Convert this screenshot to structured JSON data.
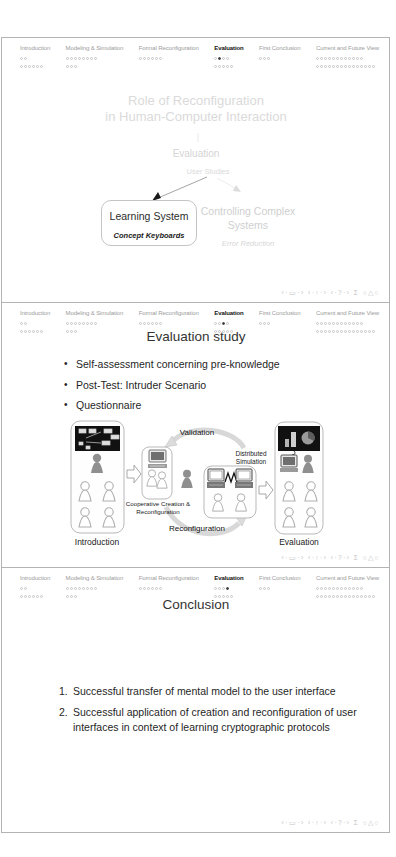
{
  "header": {
    "active_section_index": 3,
    "sections": [
      {
        "label": "Introduction",
        "rows": [
          2,
          6
        ]
      },
      {
        "label": "Modeling & Simulation",
        "rows": [
          8,
          3
        ]
      },
      {
        "label": "Formal Reconfiguration",
        "rows": [
          6
        ]
      },
      {
        "label": "Evaluation",
        "rows": [
          4,
          5
        ]
      },
      {
        "label": "First Conclusion",
        "rows": [
          3
        ]
      },
      {
        "label": "Current and Future View",
        "rows": [
          12,
          15
        ]
      }
    ]
  },
  "footer": {
    "nav_symbols": "‹·▭·›  ‹·↑·›  ‹·?·›  Σ  ○△○"
  },
  "slides": [
    {
      "name": "role-of-reconfiguration",
      "active_dot": 1,
      "title_line1": "Role of Reconfiguration",
      "title_line2": "in Human-Computer Interaction",
      "node_evaluation": "Evaluation",
      "node_user_studies": "User Studies",
      "box_learning_system": "Learning System",
      "box_learning_system_sub": "Concept Keyboards",
      "node_controlling_line1": "Controlling Complex",
      "node_controlling_line2": "Systems",
      "node_controlling_sub": "Error Reduction"
    },
    {
      "name": "evaluation-study",
      "active_dot": 2,
      "title": "Evaluation study",
      "bullets": [
        "Self-assessment concerning pre-knowledge",
        "Post-Test: Intruder Scenario",
        "Questionnaire"
      ],
      "diagram": {
        "label_introduction": "Introduction",
        "label_validation": "Validation",
        "label_distributed_line1": "Distributed",
        "label_distributed_line2": "Simulation",
        "label_cooperative_line1": "Cooperative Creation &",
        "label_cooperative_line2": "Reconfiguration",
        "label_reconfiguration": "Reconfiguration",
        "label_evaluation": "Evaluation"
      }
    },
    {
      "name": "conclusion",
      "active_dot": 3,
      "title": "Conclusion",
      "items": [
        "Successful transfer of mental model to the user interface",
        "Successful application of creation and reconfiguration of user interfaces in context of learning cryptographic protocols"
      ]
    }
  ],
  "colors": {
    "active_text": "#111111",
    "muted_text": "#9b9b9b",
    "faded_text": "#d8d8d8",
    "dot_filled": "#3d3d3d",
    "slide_border": "#b3b3b3"
  }
}
